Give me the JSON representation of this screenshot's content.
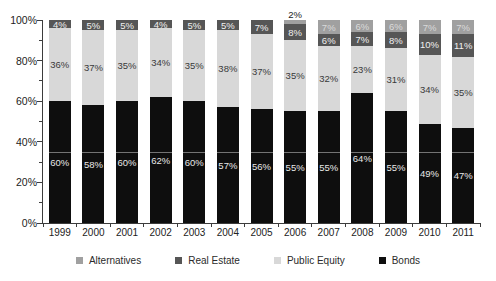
{
  "chart_data": {
    "type": "bar",
    "subtype": "stacked-100-percent",
    "title": "",
    "xlabel": "",
    "ylabel": "",
    "ylim": [
      0,
      100
    ],
    "grid": false,
    "categories": [
      "1999",
      "2000",
      "2001",
      "2002",
      "2003",
      "2004",
      "2005",
      "2006",
      "2007",
      "2008",
      "2009",
      "2010",
      "2011"
    ],
    "series": [
      {
        "name": "Bonds",
        "color": "#0e0e0e",
        "label_color": "#e8e8e8",
        "values": [
          60,
          58,
          60,
          62,
          60,
          57,
          56,
          55,
          55,
          64,
          55,
          49,
          47
        ]
      },
      {
        "name": "Public Equity",
        "color": "#d8d8d8",
        "label_color": "#3a3a3a",
        "values": [
          36,
          37,
          35,
          34,
          35,
          38,
          37,
          35,
          32,
          23,
          31,
          34,
          35
        ]
      },
      {
        "name": "Real Estate",
        "color": "#565656",
        "label_color": "#f0f0f0",
        "values": [
          4,
          5,
          5,
          4,
          5,
          5,
          7,
          8,
          6,
          7,
          8,
          10,
          11
        ]
      },
      {
        "name": "Alternatives",
        "color": "#a0a0a0",
        "label_color": "#dadada",
        "values": [
          0,
          0,
          0,
          0,
          0,
          0,
          0,
          2,
          7,
          6,
          6,
          7,
          7
        ]
      }
    ],
    "legend": [
      "Alternatives",
      "Real Estate",
      "Public Equity",
      "Bonds"
    ],
    "legend_position": "bottom",
    "y_tick_labels": [
      "0%",
      "20%",
      "40%",
      "60%",
      "80%",
      "100%"
    ],
    "y_minor_tick_step": 10,
    "bar_label_suffix": "%",
    "outside_label_threshold": 3.5,
    "outside_label_color": "#222222"
  }
}
